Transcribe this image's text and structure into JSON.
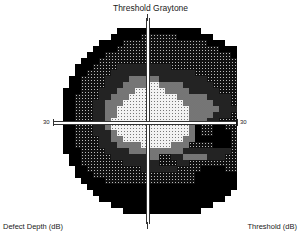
{
  "title": "Threshold Graytone",
  "axis_labels": {
    "left": "30",
    "right": "30"
  },
  "footer": {
    "left": "Defect Depth (dB)",
    "right": "Threshold (dB)"
  },
  "legend_levels": {
    "1": "very light (normal sensitivity)",
    "2": "light gray",
    "3": "mid gray",
    "4": "dark dotted",
    "5": "black (absolute defect)"
  },
  "grid": {
    "cell_size": 6,
    "rows": [
      "0000000000555555555555550000000000",
      "000000000555554444445555550000000",
      "0000000555544444444444444555000000",
      "0000005555444444444444444445550000",
      "0000055544444444444444444444455000",
      "0000555444444444444444444444445500",
      "0005554444333333333444444444444550",
      "0005544443333333333333344444444450",
      "0055444433332222233333333444444450",
      "0055444433322221122223333344444455",
      "0555444333222111112222333334444455",
      "0554444332221111111122222333344445",
      "0554443322211111111112222233344445",
      "0554443322111111111111222223334445",
      "0554443322111111111111222233344445",
      "0554443321111111111111222334444445",
      "0554443321111111111111254455444445",
      "0554443332111111111111254455544445",
      "0554444332211111111112255555544455",
      "0554444333222211111222444455544455",
      "0555444433332222222223333333344455",
      "0055444443333332244332222333444550",
      "0055444444433333344433444444444550",
      "0005544444444433333344445555444500",
      "0005554444444444444444455555555500",
      "0000555544444444444444455555555000",
      "0000055555555555555555555555550000",
      "0000005555555555555555555555500000",
      "0000000555555555555555555555000000",
      "0000000005555555555555555500000000",
      "0000000000055555555555550000000000",
      "0000000000000000000000000000000000"
    ]
  }
}
